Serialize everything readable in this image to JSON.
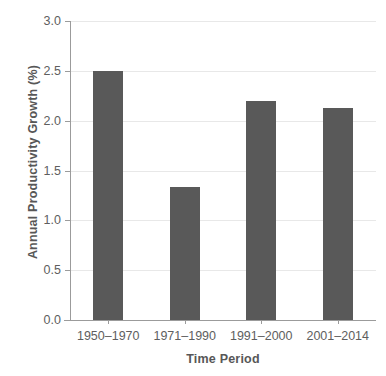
{
  "chart_data": {
    "type": "bar",
    "title": "",
    "xlabel": "Time Period",
    "ylabel": "Annual Productivity Growth (%)",
    "categories": [
      "1950–1970",
      "1971–1990",
      "1991–2000",
      "2001–2014"
    ],
    "values": [
      2.5,
      1.33,
      2.2,
      2.13
    ],
    "ylim": [
      0.0,
      3.0
    ],
    "yticks": [
      "0.0",
      "0.5",
      "1.0",
      "1.5",
      "2.0",
      "2.5",
      "3.0"
    ],
    "ytick_values": [
      0.0,
      0.5,
      1.0,
      1.5,
      2.0,
      2.5,
      3.0
    ],
    "grid": "horizontal",
    "legend": "none",
    "bar_color": "#595959",
    "grid_color": "#e8e8e8",
    "axis_color": "#9b9b9b",
    "background": "#ffffff"
  }
}
